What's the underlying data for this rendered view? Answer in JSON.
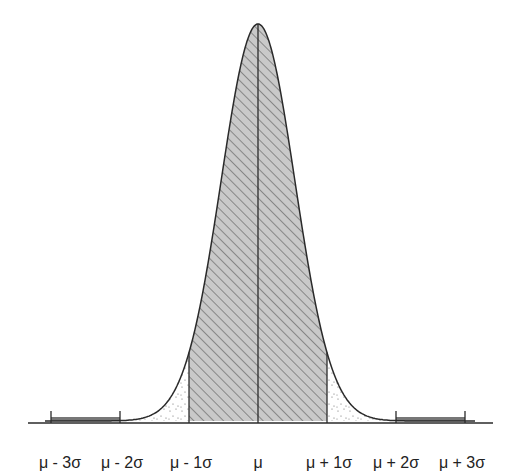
{
  "diagram": {
    "colors": {
      "stroke": "#2a2a2a",
      "hatch_fill": "#c9c9c9",
      "hatch_line": "#5a5a5a",
      "stipple": "#666666",
      "tail_bar": "#777777",
      "background": "#ffffff"
    },
    "geometry": {
      "mean_x": 258,
      "peak_y": 24,
      "baseline_y": 421,
      "sigma_px": 69,
      "curve_s": 36.8,
      "curve_x_start": 45,
      "curve_x_end": 475,
      "axis_x_start": 28,
      "axis_x_end": 493,
      "axis_y": 423
    },
    "regions": [
      {
        "name": "within-1-sigma",
        "from": -1,
        "to": 1,
        "style": "hatched"
      },
      {
        "name": "between-1-and-2-sigma",
        "from": -2,
        "to": -1,
        "style": "stippled"
      },
      {
        "name": "between-1-and-2-sigma-right",
        "from": 1,
        "to": 2,
        "style": "stippled"
      },
      {
        "name": "between-2-and-3-sigma-left",
        "from": -3,
        "to": -2,
        "style": "dark-bar"
      },
      {
        "name": "between-2-and-3-sigma-right",
        "from": 2,
        "to": 3,
        "style": "dark-bar"
      }
    ],
    "labels": [
      {
        "text": "μ - 3σ",
        "x": 60
      },
      {
        "text": "μ - 2σ",
        "x": 122
      },
      {
        "text": "μ - 1σ",
        "x": 191
      },
      {
        "text": "μ",
        "x": 258
      },
      {
        "text": "μ + 1σ",
        "x": 329
      },
      {
        "text": "μ + 2σ",
        "x": 396
      },
      {
        "text": "μ + 3σ",
        "x": 462
      }
    ]
  }
}
